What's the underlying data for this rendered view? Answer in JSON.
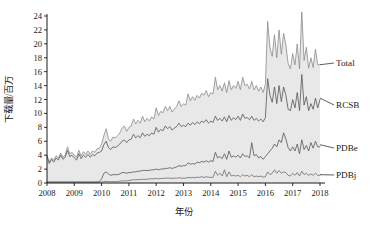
{
  "chart_data": {
    "type": "area",
    "title": "",
    "xlabel": "年份",
    "ylabel": "下载量/百万",
    "xlim": [
      2008.0,
      2018.0
    ],
    "ylim": [
      0,
      24
    ],
    "ytick_step": 2,
    "grid": false,
    "legend_position": "right-inline-labels",
    "x_ticks": [
      "2008",
      "2009",
      "2010",
      "2011",
      "2012",
      "2013",
      "2014",
      "2015",
      "2016",
      "2017",
      "2018"
    ],
    "y_ticks": [
      "0",
      "2",
      "4",
      "6",
      "8",
      "10",
      "12",
      "14",
      "16",
      "18",
      "20",
      "22",
      "24"
    ],
    "fill_under": "Total",
    "fill_color": "#e8e8e8",
    "line_color": "#5a5a5a",
    "x": [
      2008.0,
      2008.083,
      2008.167,
      2008.25,
      2008.333,
      2008.417,
      2008.5,
      2008.583,
      2008.667,
      2008.75,
      2008.833,
      2008.917,
      2009.0,
      2009.083,
      2009.167,
      2009.25,
      2009.333,
      2009.417,
      2009.5,
      2009.583,
      2009.667,
      2009.75,
      2009.833,
      2009.917,
      2010.0,
      2010.083,
      2010.167,
      2010.25,
      2010.333,
      2010.417,
      2010.5,
      2010.583,
      2010.667,
      2010.75,
      2010.833,
      2010.917,
      2011.0,
      2011.083,
      2011.167,
      2011.25,
      2011.333,
      2011.417,
      2011.5,
      2011.583,
      2011.667,
      2011.75,
      2011.833,
      2011.917,
      2012.0,
      2012.083,
      2012.167,
      2012.25,
      2012.333,
      2012.417,
      2012.5,
      2012.583,
      2012.667,
      2012.75,
      2012.833,
      2012.917,
      2013.0,
      2013.083,
      2013.167,
      2013.25,
      2013.333,
      2013.417,
      2013.5,
      2013.583,
      2013.667,
      2013.75,
      2013.833,
      2013.917,
      2014.0,
      2014.083,
      2014.167,
      2014.25,
      2014.333,
      2014.417,
      2014.5,
      2014.583,
      2014.667,
      2014.75,
      2014.833,
      2014.917,
      2015.0,
      2015.083,
      2015.167,
      2015.25,
      2015.333,
      2015.417,
      2015.5,
      2015.583,
      2015.667,
      2015.75,
      2015.833,
      2015.917,
      2016.0,
      2016.083,
      2016.167,
      2016.25,
      2016.333,
      2016.417,
      2016.5,
      2016.583,
      2016.667,
      2016.75,
      2016.833,
      2016.917,
      2017.0,
      2017.083,
      2017.167,
      2017.25,
      2017.333,
      2017.417,
      2017.5,
      2017.583,
      2017.667,
      2017.75,
      2017.833,
      2017.917,
      2018.0
    ],
    "series": [
      {
        "name": "Total",
        "label_anchor_x": 2018.0,
        "label_anchor_y": 17.0,
        "values": [
          4.0,
          3.0,
          3.6,
          3.3,
          3.9,
          3.6,
          4.3,
          3.7,
          4.0,
          5.2,
          4.2,
          4.4,
          4.0,
          3.7,
          4.7,
          3.9,
          4.5,
          4.1,
          4.6,
          4.1,
          4.6,
          4.4,
          4.9,
          5.0,
          5.6,
          6.8,
          7.8,
          6.4,
          6.0,
          6.6,
          6.5,
          6.8,
          7.2,
          7.9,
          8.2,
          7.4,
          8.0,
          8.2,
          9.2,
          8.5,
          9.0,
          8.6,
          9.6,
          8.8,
          9.3,
          8.9,
          9.5,
          9.2,
          10.8,
          9.7,
          10.3,
          10.1,
          11.0,
          10.4,
          11.0,
          10.2,
          10.6,
          11.0,
          11.8,
          11.0,
          11.4,
          11.2,
          12.8,
          11.8,
          12.4,
          11.9,
          12.6,
          12.2,
          12.9,
          12.6,
          13.3,
          12.4,
          13.0,
          12.8,
          15.2,
          13.4,
          14.0,
          13.2,
          14.4,
          13.0,
          14.7,
          13.4,
          14.0,
          13.6,
          14.6,
          13.4,
          15.2,
          14.0,
          14.2,
          13.5,
          14.6,
          13.4,
          14.0,
          13.2,
          13.8,
          13.0,
          14.2,
          23.2,
          19.4,
          18.2,
          21.3,
          18.0,
          22.0,
          18.5,
          21.5,
          19.8,
          17.2,
          16.4,
          18.6,
          17.0,
          20.0,
          16.4,
          24.6,
          17.6,
          19.5,
          16.5,
          18.0,
          16.6,
          19.2,
          17.0,
          17.0
        ]
      },
      {
        "name": "RCSB",
        "label_anchor_x": 2018.0,
        "label_anchor_y": 12.2,
        "values": [
          3.8,
          2.8,
          3.4,
          3.0,
          3.6,
          3.3,
          4.0,
          3.4,
          3.7,
          4.7,
          3.8,
          4.0,
          3.6,
          3.3,
          4.2,
          3.5,
          4.0,
          3.7,
          4.1,
          3.7,
          4.1,
          3.9,
          4.3,
          4.4,
          4.6,
          5.5,
          6.0,
          5.1,
          4.8,
          5.2,
          5.1,
          5.3,
          5.6,
          6.0,
          6.2,
          5.8,
          6.2,
          6.3,
          7.0,
          6.5,
          6.8,
          6.5,
          7.2,
          6.7,
          7.0,
          6.8,
          7.2,
          7.0,
          8.0,
          7.3,
          7.7,
          7.5,
          8.2,
          7.8,
          8.1,
          7.6,
          7.9,
          8.1,
          8.6,
          8.1,
          8.3,
          8.1,
          8.6,
          8.3,
          8.7,
          8.4,
          8.8,
          8.5,
          8.9,
          8.7,
          9.1,
          8.6,
          8.9,
          8.7,
          9.6,
          9.0,
          9.3,
          8.9,
          9.5,
          8.8,
          9.7,
          9.0,
          9.4,
          9.1,
          9.6,
          9.0,
          9.9,
          9.3,
          9.4,
          9.1,
          9.6,
          9.0,
          9.3,
          8.9,
          9.2,
          8.8,
          9.4,
          15.0,
          12.6,
          11.6,
          13.8,
          11.4,
          14.0,
          11.7,
          13.8,
          12.6,
          10.6,
          10.4,
          12.0,
          10.8,
          13.0,
          10.4,
          15.6,
          11.2,
          12.4,
          10.4,
          11.4,
          10.6,
          12.2,
          10.8,
          12.0
        ]
      },
      {
        "name": "PDBe",
        "label_anchor_x": 2018.0,
        "label_anchor_y": 5.5,
        "values": [
          0.15,
          0.15,
          0.15,
          0.15,
          0.15,
          0.15,
          0.15,
          0.15,
          0.15,
          0.15,
          0.15,
          0.15,
          0.15,
          0.15,
          0.15,
          0.15,
          0.15,
          0.15,
          0.15,
          0.15,
          0.15,
          0.15,
          0.15,
          0.2,
          0.6,
          1.4,
          1.6,
          1.3,
          1.1,
          1.2,
          1.2,
          1.2,
          1.3,
          1.5,
          1.5,
          1.4,
          1.5,
          1.5,
          1.6,
          1.6,
          1.7,
          1.7,
          1.8,
          1.8,
          1.8,
          1.8,
          1.9,
          1.9,
          2.0,
          1.9,
          2.0,
          2.0,
          2.1,
          2.1,
          2.2,
          2.1,
          2.2,
          2.3,
          2.5,
          2.4,
          2.5,
          2.5,
          2.9,
          2.7,
          2.8,
          2.7,
          3.0,
          2.9,
          3.1,
          3.0,
          3.2,
          3.0,
          3.2,
          3.1,
          4.4,
          3.6,
          3.8,
          3.5,
          4.2,
          3.4,
          4.6,
          3.7,
          3.9,
          3.7,
          4.0,
          3.6,
          4.2,
          3.8,
          3.9,
          3.6,
          5.8,
          3.9,
          4.1,
          3.6,
          3.8,
          3.4,
          3.8,
          4.2,
          4.6,
          5.0,
          5.6,
          5.2,
          6.2,
          5.8,
          7.2,
          6.3,
          5.1,
          4.6,
          5.2,
          4.6,
          5.6,
          4.2,
          6.2,
          4.8,
          5.4,
          4.6,
          5.8,
          5.0,
          6.0,
          5.2,
          5.2
        ]
      },
      {
        "name": "PDBj",
        "label_anchor_x": 2018.0,
        "label_anchor_y": 1.2,
        "values": [
          0.1,
          0.1,
          0.1,
          0.1,
          0.1,
          0.1,
          0.1,
          0.1,
          0.1,
          0.1,
          0.1,
          0.1,
          0.1,
          0.1,
          0.1,
          0.1,
          0.1,
          0.1,
          0.1,
          0.1,
          0.1,
          0.1,
          0.1,
          0.1,
          0.15,
          0.2,
          0.25,
          0.2,
          0.2,
          0.2,
          0.2,
          0.2,
          0.25,
          0.3,
          0.3,
          0.3,
          0.35,
          0.4,
          0.5,
          0.45,
          0.5,
          0.5,
          0.55,
          0.5,
          0.55,
          0.6,
          0.6,
          0.6,
          0.65,
          0.6,
          0.65,
          0.65,
          0.7,
          0.7,
          0.7,
          0.65,
          0.7,
          0.7,
          0.75,
          0.7,
          0.7,
          0.7,
          0.8,
          0.75,
          0.8,
          0.75,
          0.85,
          0.8,
          0.9,
          0.8,
          0.9,
          0.85,
          0.8,
          0.8,
          1.7,
          1.1,
          1.4,
          1.0,
          1.9,
          0.9,
          1.6,
          1.0,
          1.1,
          1.0,
          1.1,
          0.9,
          1.2,
          1.0,
          1.1,
          0.9,
          1.2,
          0.9,
          1.0,
          0.9,
          1.0,
          0.85,
          0.9,
          1.6,
          1.2,
          1.4,
          1.9,
          1.4,
          1.8,
          1.4,
          1.6,
          1.5,
          1.1,
          1.0,
          1.4,
          1.1,
          1.5,
          1.0,
          1.7,
          1.2,
          1.4,
          1.1,
          1.3,
          1.1,
          1.4,
          1.1,
          1.1
        ]
      }
    ]
  },
  "axes": {
    "y_axis_title": "下载量/百万",
    "x_axis_title": "年份"
  },
  "labels": {
    "total": "Total",
    "rcsb": "RCSB",
    "pdbe": "PDBe",
    "pdbj": "PDBj"
  }
}
